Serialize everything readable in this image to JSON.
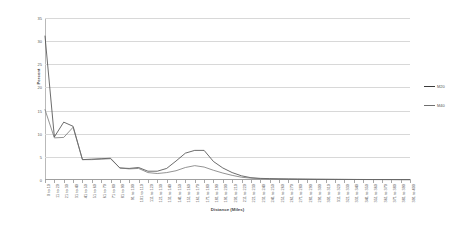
{
  "chart_data": {
    "type": "line",
    "title": "",
    "xlabel": "Distance (Miles)",
    "ylabel": "Percent",
    "ylim": [
      0,
      35
    ],
    "yticks": [
      0,
      5,
      10,
      15,
      20,
      25,
      30,
      35
    ],
    "grid": true,
    "legend_position": "right",
    "categories": [
      "0 to 10",
      "11 to 20",
      "21 to 30",
      "31 to 40",
      "41 to 50",
      "51 to 60",
      "61 to 70",
      "71 to 80",
      "81 to 90",
      "91 to 100",
      "101 to 110",
      "111 to 120",
      "121 to 130",
      "131 to 140",
      "141 to 150",
      "151 to 160",
      "161 to 170",
      "171 to 180",
      "181 to 190",
      "191 to 200",
      "201 to 210",
      "211 to 220",
      "221 to 230",
      "231 to 240",
      "241 to 250",
      "251 to 260",
      "261 to 270",
      "271 to 280",
      "281 to 290",
      "291 to 300",
      "301 to 310",
      "311 to 320",
      "321 to 330",
      "331 to 340",
      "341 to 350",
      "351 to 360",
      "361 to 370",
      "371 to 380",
      "381 to 390",
      "391 to 400"
    ],
    "series": [
      {
        "name": "M20",
        "color": "#3b3b3b",
        "values": [
          31.1,
          9.3,
          12.5,
          11.6,
          4.4,
          4.5,
          4.6,
          4.7,
          2.6,
          2.5,
          2.7,
          1.9,
          1.9,
          2.5,
          4.1,
          5.8,
          6.4,
          6.4,
          4.0,
          2.6,
          1.6,
          0.9,
          0.5,
          0.35,
          0.3,
          0.25,
          0.22,
          0.2,
          0.18,
          0.16,
          0.15,
          0.14,
          0.13,
          0.12,
          0.11,
          0.1,
          0.1,
          0.09,
          0.08,
          0.08
        ]
      },
      {
        "name": "M40",
        "color": "#6f6f6f",
        "values": [
          15.2,
          9.1,
          9.2,
          11.4,
          4.4,
          4.4,
          4.5,
          4.6,
          2.6,
          2.4,
          2.5,
          1.6,
          1.4,
          1.6,
          2.0,
          2.7,
          3.1,
          2.8,
          2.1,
          1.5,
          1.0,
          0.6,
          0.4,
          0.3,
          0.25,
          0.22,
          0.2,
          0.18,
          0.16,
          0.15,
          0.14,
          0.13,
          0.12,
          0.11,
          0.1,
          0.1,
          0.09,
          0.09,
          0.08,
          0.08
        ]
      }
    ]
  },
  "legend": {
    "items": [
      {
        "label": "M20",
        "color": "#3b3b3b"
      },
      {
        "label": "M40",
        "color": "#6f6f6f"
      }
    ]
  },
  "axes": {
    "y_title": "Percent",
    "x_title": "Distance (Miles)"
  }
}
